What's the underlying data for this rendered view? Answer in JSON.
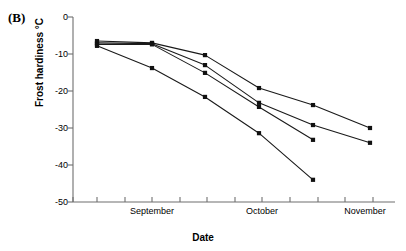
{
  "figure": {
    "panel_label": "(B)",
    "x_axis_title": "Date",
    "y_axis_title": "Frost hardiness °C"
  },
  "axes": {
    "y_ticks": [
      "0",
      "-10",
      "-20",
      "-30",
      "-40",
      "-50"
    ],
    "x_tick_labels": [
      "September",
      "October",
      "November"
    ]
  },
  "chart_data": {
    "type": "line",
    "title": "(B)",
    "xlabel": "Date",
    "ylabel": "Frost hardiness °C",
    "ylim": [
      -50,
      0
    ],
    "yticks": [
      0,
      -10,
      -20,
      -30,
      -40,
      -50
    ],
    "grid": false,
    "legend": "none",
    "marker": "filled-square",
    "x_axis_type": "date",
    "x_tick_labels": [
      "September",
      "October",
      "November"
    ],
    "x_tick_label_positions": [
      152,
      262,
      365
    ],
    "x_tick_positions": [
      73,
      97,
      125,
      152,
      180,
      207,
      235,
      262,
      290,
      318,
      345,
      373
    ],
    "series": [
      {
        "name": "Series 1",
        "x": [
          97,
          152,
          205,
          259,
          313,
          370
        ],
        "values": [
          -6.5,
          -7.0,
          -10.3,
          -19.2,
          -23.8,
          -30.0
        ]
      },
      {
        "name": "Series 2",
        "x": [
          97,
          152,
          205,
          259,
          313,
          370
        ],
        "values": [
          -7.0,
          -7.2,
          -13.0,
          -23.2,
          -29.2,
          -34.0
        ]
      },
      {
        "name": "Series 3",
        "x": [
          97,
          152,
          205,
          259,
          313
        ],
        "values": [
          -7.4,
          -7.4,
          -15.1,
          -24.3,
          -33.2
        ]
      },
      {
        "name": "Series 4",
        "x": [
          97,
          152,
          205,
          259,
          313
        ],
        "values": [
          -7.8,
          -13.8,
          -21.6,
          -31.4,
          -44.0
        ]
      }
    ]
  }
}
